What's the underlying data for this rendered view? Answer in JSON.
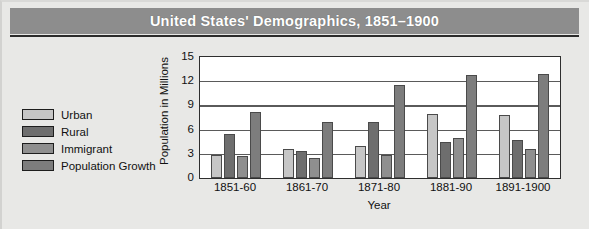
{
  "figure": {
    "title": "United States' Demographics, 1851–1900"
  },
  "legend": {
    "items": [
      {
        "label": "Urban",
        "color": "#c6c6c6"
      },
      {
        "label": "Rural",
        "color": "#6e6e6e"
      },
      {
        "label": "Immigrant",
        "color": "#8f8f8f"
      },
      {
        "label": "Population Growth",
        "color": "#7d7d7d"
      }
    ]
  },
  "chart_data": {
    "type": "bar",
    "title": "United States' Demographics, 1851–1900",
    "xlabel": "Year",
    "ylabel": "Population in Millions",
    "categories": [
      "1851-60",
      "1861-70",
      "1871-80",
      "1881-90",
      "1891-1900"
    ],
    "ylim": [
      0,
      15
    ],
    "yticks": [
      0,
      3,
      6,
      9,
      12,
      15
    ],
    "grid": true,
    "legend_position": "left-outside",
    "series": [
      {
        "name": "Urban",
        "color": "#c6c6c6",
        "values": [
          2.8,
          3.6,
          4.0,
          7.9,
          7.8
        ]
      },
      {
        "name": "Rural",
        "color": "#6e6e6e",
        "values": [
          5.5,
          3.4,
          7.0,
          4.5,
          4.7
        ]
      },
      {
        "name": "Immigrant",
        "color": "#8f8f8f",
        "values": [
          2.7,
          2.5,
          2.8,
          4.9,
          3.6
        ]
      },
      {
        "name": "Population Growth",
        "color": "#7d7d7d",
        "values": [
          8.2,
          6.9,
          11.5,
          12.8,
          12.9
        ]
      }
    ]
  }
}
